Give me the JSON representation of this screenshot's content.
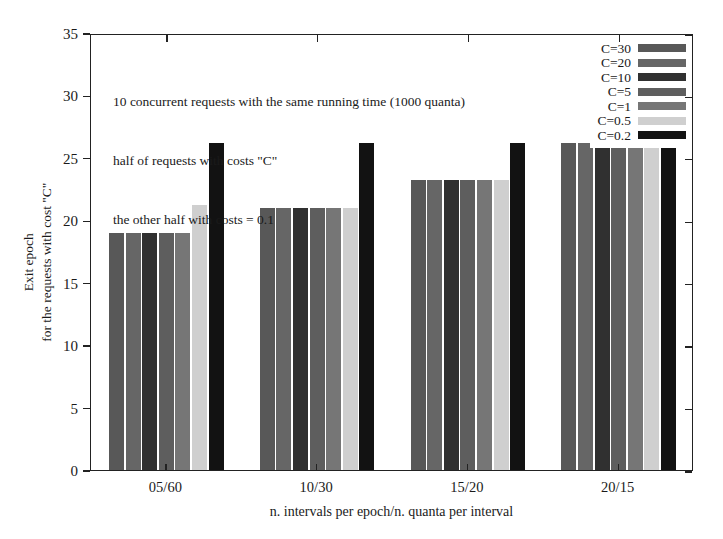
{
  "chart_data": {
    "type": "bar",
    "title": "",
    "subtitle": "",
    "xlabel": "n. intervals per epoch/n. quanta per interval",
    "ylabel": "Exit epoch\nfor the requests with cost \"C\"",
    "ylabel_lines": [
      "Exit epoch",
      "for the requests with cost \"C\""
    ],
    "categories": [
      "05/60",
      "10/30",
      "15/20",
      "20/15"
    ],
    "ylim": [
      0,
      35
    ],
    "yticks": [
      0,
      5,
      10,
      15,
      20,
      25,
      30,
      35
    ],
    "grid": false,
    "legend_position": "top-right-inside",
    "series": [
      {
        "name": "C=30",
        "color": "#585858",
        "values": [
          19.0,
          21.0,
          23.2,
          26.2
        ]
      },
      {
        "name": "C=20",
        "color": "#666666",
        "values": [
          19.0,
          21.0,
          23.2,
          26.2
        ]
      },
      {
        "name": "C=10",
        "color": "#303030",
        "values": [
          19.0,
          21.0,
          23.2,
          26.2
        ]
      },
      {
        "name": "C=5",
        "color": "#5e5e5e",
        "values": [
          19.0,
          21.0,
          23.2,
          26.2
        ]
      },
      {
        "name": "C=1",
        "color": "#767676",
        "values": [
          19.0,
          21.0,
          23.2,
          26.2
        ]
      },
      {
        "name": "C=0.5",
        "color": "#cfcfcf",
        "values": [
          21.2,
          21.0,
          23.2,
          26.2
        ]
      },
      {
        "name": "C=0.2",
        "color": "#121212",
        "values": [
          26.2,
          26.2,
          26.2,
          26.2
        ]
      }
    ],
    "annotation": [
      "10 concurrent requests with the same running time (1000 quanta)",
      "half of requests with costs \"C\"",
      "the other half with costs = 0.1"
    ]
  },
  "axes": {
    "y_tick_labels": [
      "0",
      "5",
      "10",
      "15",
      "20",
      "25",
      "30",
      "35"
    ],
    "x_tick_labels": [
      "05/60",
      "10/30",
      "15/20",
      "20/15"
    ],
    "x_title": "n. intervals per epoch/n. quanta per interval",
    "y_title_line1": "Exit epoch",
    "y_title_line2": "for the requests with cost \"C\""
  },
  "legend": {
    "entries": [
      {
        "label": "C=30",
        "color": "#585858"
      },
      {
        "label": "C=20",
        "color": "#666666"
      },
      {
        "label": "C=10",
        "color": "#303030"
      },
      {
        "label": "C=5",
        "color": "#5e5e5e"
      },
      {
        "label": "C=1",
        "color": "#767676"
      },
      {
        "label": "C=0.5",
        "color": "#cfcfcf"
      },
      {
        "label": "C=0.2",
        "color": "#121212"
      }
    ]
  },
  "annotation": {
    "line1": "10 concurrent requests with the same running time (1000 quanta)",
    "line2": "half of requests with costs \"C\"",
    "line3": "the other half with costs = 0.1"
  }
}
